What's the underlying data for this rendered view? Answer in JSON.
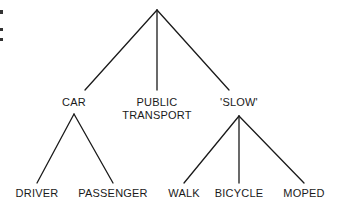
{
  "diagram": {
    "type": "tree",
    "line_color": "#1a1a1a",
    "root": {
      "label": "",
      "x": 157,
      "y": 10
    },
    "nodes": [
      {
        "id": "car",
        "label": "CAR",
        "x": 74,
        "y": 113,
        "label_y": 96
      },
      {
        "id": "public_transport",
        "label_lines": [
          "PUBLIC",
          "TRANSPORT"
        ],
        "x": 157,
        "label_y": 96
      },
      {
        "id": "slow",
        "label": "'SLOW'",
        "x": 239,
        "y": 116,
        "label_y": 96
      }
    ],
    "leaves": [
      {
        "id": "driver",
        "label": "DRIVER",
        "parent": "car",
        "x": 37,
        "label_y": 187
      },
      {
        "id": "passenger",
        "label": "PASSENGER",
        "parent": "car",
        "x": 113,
        "label_y": 187
      },
      {
        "id": "walk",
        "label": "WALK",
        "parent": "slow",
        "x": 183,
        "label_y": 187
      },
      {
        "id": "bicycle",
        "label": "BICYCLE",
        "parent": "slow",
        "x": 239,
        "label_y": 187
      },
      {
        "id": "moped",
        "label": "MOPED",
        "parent": "slow",
        "x": 304,
        "label_y": 187
      }
    ]
  }
}
